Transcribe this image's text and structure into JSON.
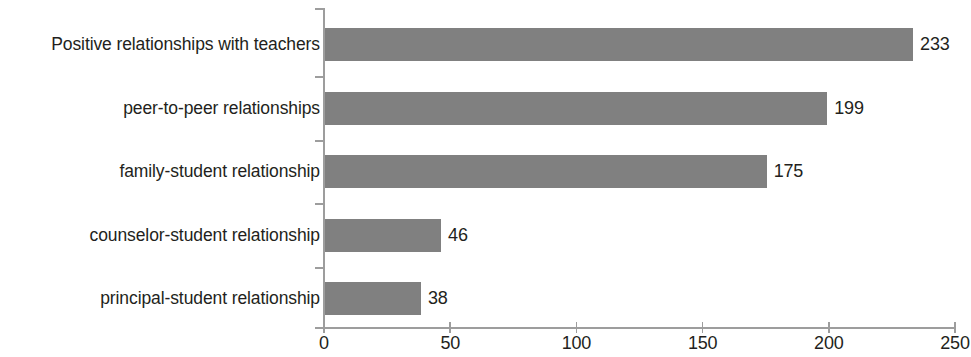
{
  "chart_data": {
    "type": "bar",
    "orientation": "horizontal",
    "title": "",
    "subtitle": "",
    "xlabel": "",
    "ylabel": "",
    "xlim": [
      0,
      250
    ],
    "xticks": [
      "0",
      "50",
      "100",
      "150",
      "200",
      "250"
    ],
    "xtick_values": [
      0,
      50,
      100,
      150,
      200,
      250
    ],
    "grid": false,
    "legend": false,
    "legend_position": "none",
    "bar_color": "#808080",
    "axis_color": "#9d9d9d",
    "text_color": "#231f20",
    "background_color": "#ffffff",
    "categories": [
      "Positive relationships with teachers",
      "peer-to-peer relationships",
      "family-student relationship",
      "counselor-student relationship",
      "principal-student relationship"
    ],
    "values": [
      233,
      199,
      175,
      46,
      38
    ],
    "value_labels": [
      "233",
      "199",
      "175",
      "46",
      "38"
    ],
    "series": [
      {
        "name": "",
        "values": [
          233,
          199,
          175,
          46,
          38
        ]
      }
    ],
    "bars": [
      {
        "category": "Positive relationships with teachers",
        "value": 233,
        "label": "233"
      },
      {
        "category": "peer-to-peer relationships",
        "value": 199,
        "label": "199"
      },
      {
        "category": "family-student relationship",
        "value": 175,
        "label": "175"
      },
      {
        "category": "counselor-student relationship",
        "value": 46,
        "label": "46"
      },
      {
        "category": "principal-student relationship",
        "value": 38,
        "label": "38"
      }
    ]
  }
}
